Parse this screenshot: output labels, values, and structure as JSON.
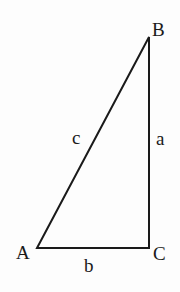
{
  "diagram": {
    "type": "right-triangle",
    "vertices": {
      "A": {
        "label": "A",
        "x": 37,
        "y": 248
      },
      "B": {
        "label": "B",
        "x": 149,
        "y": 37
      },
      "C": {
        "label": "C",
        "x": 149,
        "y": 248
      }
    },
    "sides": {
      "a": {
        "label": "a",
        "from": "B",
        "to": "C"
      },
      "b": {
        "label": "b",
        "from": "A",
        "to": "C"
      },
      "c": {
        "label": "c",
        "from": "A",
        "to": "B"
      }
    },
    "right_angle_at": "C",
    "stroke_color": "#1a1a1a"
  }
}
